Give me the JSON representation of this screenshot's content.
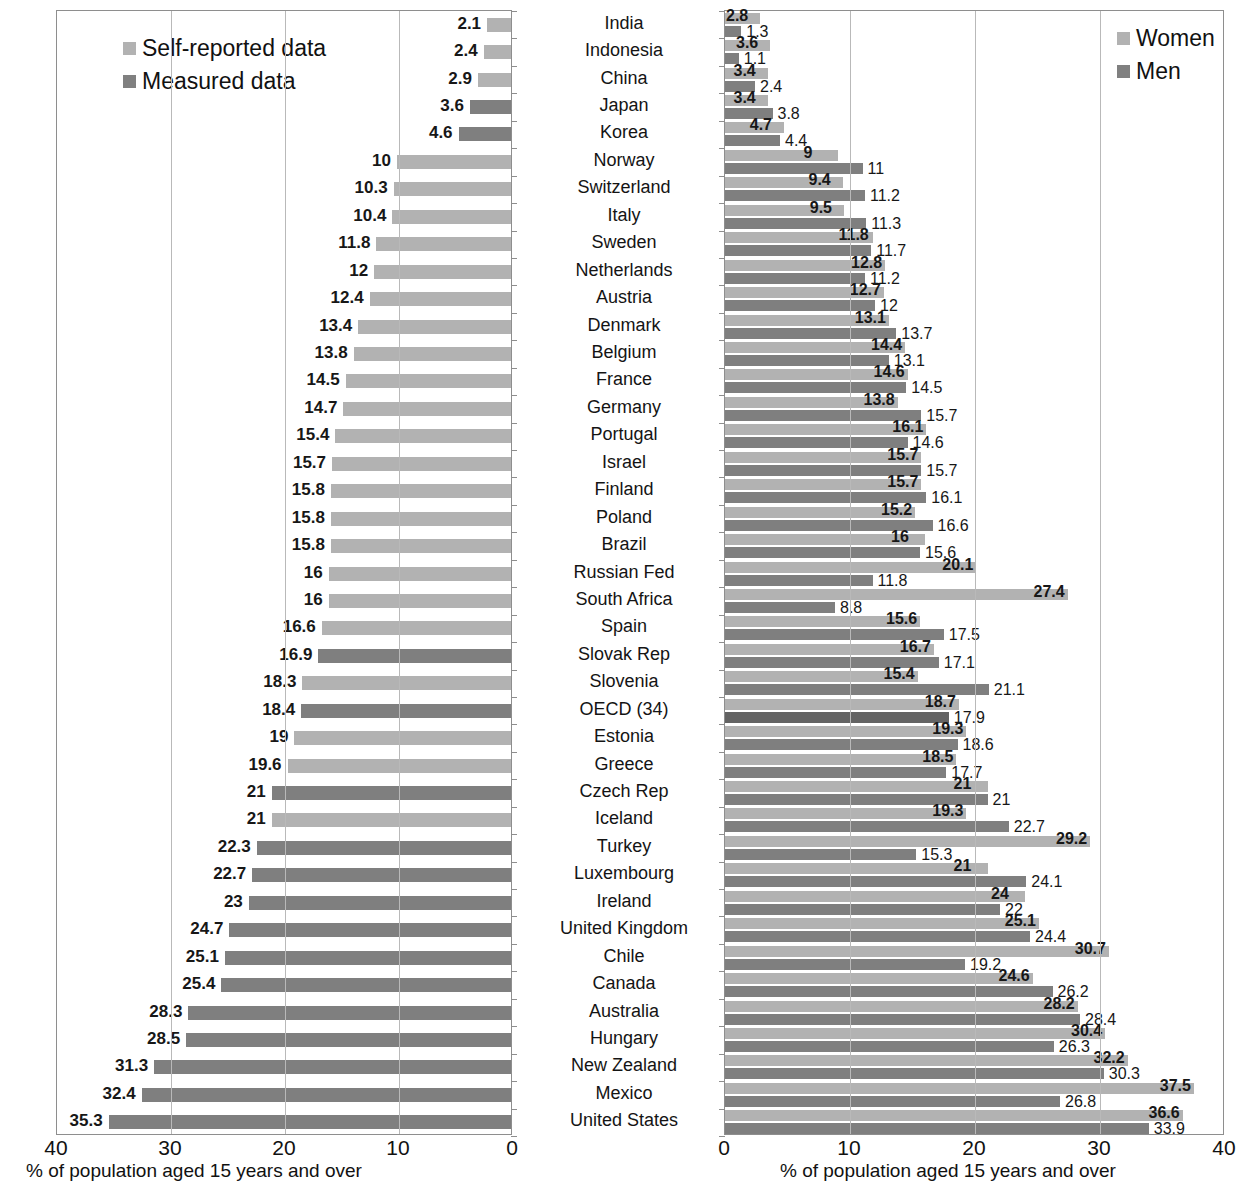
{
  "left_chart": {
    "legend": [
      {
        "label": "Self-reported data",
        "swatch": "light"
      },
      {
        "label": "Measured data",
        "swatch": "dark"
      }
    ],
    "axis_title": "% of population aged 15 years and over",
    "xticks": [
      "40",
      "30",
      "20",
      "10",
      "0"
    ]
  },
  "right_chart": {
    "legend": [
      {
        "label": "Women",
        "swatch": "light"
      },
      {
        "label": "Men",
        "swatch": "dark"
      }
    ],
    "axis_title": "% of population aged 15 years and over",
    "xticks": [
      "0",
      "10",
      "20",
      "30",
      "40"
    ]
  },
  "chart_data": [
    {
      "id": "obesity-by-source",
      "type": "bar",
      "orientation": "horizontal-reversed",
      "title": "",
      "xlabel": "% of population aged 15 years and over",
      "ylabel": "",
      "xlim": [
        0,
        40
      ],
      "xticks": [
        40,
        30,
        20,
        10,
        0
      ],
      "grid": true,
      "legend": [
        "Self-reported data",
        "Measured data"
      ],
      "legend_position": "top-left",
      "categories": [
        "India",
        "Indonesia",
        "China",
        "Japan",
        "Korea",
        "Norway",
        "Switzerland",
        "Italy",
        "Sweden",
        "Netherlands",
        "Austria",
        "Denmark",
        "Belgium",
        "France",
        "Germany",
        "Portugal",
        "Israel",
        "Finland",
        "Poland",
        "Brazil",
        "Russian Fed",
        "South Africa",
        "Spain",
        "Slovak Rep",
        "Slovenia",
        "OECD (34)",
        "Estonia",
        "Greece",
        "Czech Rep",
        "Iceland",
        "Turkey",
        "Luxembourg",
        "Ireland",
        "United Kingdom",
        "Chile",
        "Canada",
        "Australia",
        "Hungary",
        "New Zealand",
        "Mexico",
        "United States"
      ],
      "values": [
        2.1,
        2.4,
        2.9,
        3.6,
        4.6,
        10,
        10.3,
        10.4,
        11.8,
        12,
        12.4,
        13.4,
        13.8,
        14.5,
        14.7,
        15.4,
        15.7,
        15.8,
        15.8,
        15.8,
        16,
        16,
        16.6,
        16.9,
        18.3,
        18.4,
        19,
        19.6,
        21,
        21,
        22.3,
        22.7,
        23,
        24.7,
        25.1,
        25.4,
        28.3,
        28.5,
        31.3,
        32.4,
        35.3
      ],
      "value_labels": [
        "2.1",
        "2.4",
        "2.9",
        "3.6",
        "4.6",
        "10",
        "10.3",
        "10.4",
        "11.8",
        "12",
        "12.4",
        "13.4",
        "13.8",
        "14.5",
        "14.7",
        "15.4",
        "15.7",
        "15.8",
        "15.8",
        "15.8",
        "16",
        "16",
        "16.6",
        "16.9",
        "18.3",
        "18.4",
        "19",
        "19.6",
        "21",
        "21",
        "22.3",
        "22.7",
        "23",
        "24.7",
        "25.1",
        "25.4",
        "28.3",
        "28.5",
        "31.3",
        "32.4",
        "35.3"
      ],
      "source": [
        "self",
        "self",
        "self",
        "measured",
        "measured",
        "self",
        "self",
        "self",
        "self",
        "self",
        "self",
        "self",
        "self",
        "self",
        "self",
        "self",
        "self",
        "self",
        "self",
        "self",
        "self",
        "self",
        "self",
        "measured",
        "self",
        "measured",
        "self",
        "self",
        "measured",
        "self",
        "measured",
        "measured",
        "measured",
        "measured",
        "measured",
        "measured",
        "measured",
        "measured",
        "measured",
        "measured",
        "measured"
      ]
    },
    {
      "id": "obesity-by-sex",
      "type": "bar",
      "orientation": "horizontal",
      "title": "",
      "xlabel": "% of population aged 15 years and over",
      "ylabel": "",
      "xlim": [
        0,
        40
      ],
      "xticks": [
        0,
        10,
        20,
        30,
        40
      ],
      "grid": true,
      "legend": [
        "Women",
        "Men"
      ],
      "legend_position": "top-right",
      "categories": [
        "India",
        "Indonesia",
        "China",
        "Japan",
        "Korea",
        "Norway",
        "Switzerland",
        "Italy",
        "Sweden",
        "Netherlands",
        "Austria",
        "Denmark",
        "Belgium",
        "France",
        "Germany",
        "Portugal",
        "Israel",
        "Finland",
        "Poland",
        "Brazil",
        "Russian Fed",
        "South Africa",
        "Spain",
        "Slovak Rep",
        "Slovenia",
        "OECD (34)",
        "Estonia",
        "Greece",
        "Czech Rep",
        "Iceland",
        "Turkey",
        "Luxembourg",
        "Ireland",
        "United Kingdom",
        "Chile",
        "Canada",
        "Australia",
        "Hungary",
        "New Zealand",
        "Mexico",
        "United States"
      ],
      "series": [
        {
          "name": "Women",
          "values": [
            2.8,
            3.6,
            3.4,
            3.4,
            4.7,
            9,
            9.4,
            9.5,
            11.8,
            12.8,
            12.7,
            13.1,
            14.4,
            14.6,
            13.8,
            16.1,
            15.7,
            15.7,
            15.2,
            16,
            20.1,
            27.4,
            15.6,
            16.7,
            15.4,
            18.7,
            19.3,
            18.5,
            21,
            19.3,
            29.2,
            21,
            24,
            25.1,
            30.7,
            24.6,
            28.2,
            30.4,
            32.2,
            37.5,
            36.6
          ],
          "value_labels": [
            "2.8",
            "3.6",
            "3.4",
            "3.4",
            "4.7",
            "9",
            "9.4",
            "9.5",
            "11.8",
            "12.8",
            "12.7",
            "13.1",
            "14.4",
            "14.6",
            "13.8",
            "16.1",
            "15.7",
            "15.7",
            "15.2",
            "16",
            "20.1",
            "27.4",
            "15.6",
            "16.7",
            "15.4",
            "18.7",
            "19.3",
            "18.5",
            "21",
            "19.3",
            "29.2",
            "21",
            "24",
            "25.1",
            "30.7",
            "24.6",
            "28.2",
            "30.4",
            "32.2",
            "37.5",
            "36.6"
          ]
        },
        {
          "name": "Men",
          "values": [
            1.3,
            1.1,
            2.4,
            3.8,
            4.4,
            11,
            11.2,
            11.3,
            11.7,
            11.2,
            12,
            13.7,
            13.1,
            14.5,
            15.7,
            14.6,
            15.7,
            16.1,
            16.6,
            15.6,
            11.8,
            8.8,
            17.5,
            17.1,
            21.1,
            17.9,
            18.6,
            17.7,
            21,
            22.7,
            15.3,
            24.1,
            22,
            24.4,
            19.2,
            26.2,
            28.4,
            26.3,
            30.3,
            26.8,
            33.9
          ],
          "value_labels": [
            "1.3",
            "1.1",
            "2.4",
            "3.8",
            "4.4",
            "11",
            "11.2",
            "11.3",
            "11.7",
            "11.2",
            "12",
            "13.7",
            "13.1",
            "14.5",
            "15.7",
            "14.6",
            "15.7",
            "16.1",
            "16.6",
            "15.6",
            "11.8",
            "8.8",
            "17.5",
            "17.1",
            "21.1",
            "17.9",
            "18.6",
            "17.7",
            "21",
            "22.7",
            "15.3",
            "24.1",
            "22",
            "24.4",
            "19.2",
            "26.2",
            "28.4",
            "26.3",
            "30.3",
            "26.8",
            "33.9"
          ]
        }
      ]
    }
  ],
  "colors": {
    "light_gray": "#b2b2b2",
    "dark_gray": "#7f7f7f",
    "darker_gray": "#636363",
    "gridline": "#b9b9b9",
    "frame": "#8e8e8e",
    "text": "#141414"
  }
}
